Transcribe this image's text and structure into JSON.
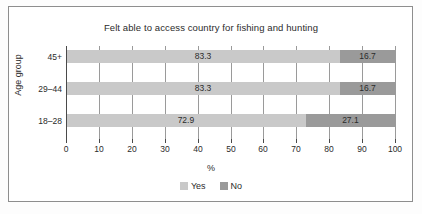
{
  "chart_data": {
    "type": "bar",
    "orientation": "horizontal",
    "stacked": true,
    "stack_total": 100,
    "title": "Felt able to access country for fishing and hunting",
    "xlabel": "%",
    "ylabel": "Age group",
    "categories": [
      "18–28",
      "29–44",
      "45+"
    ],
    "categories_top_to_bottom": [
      "45+",
      "29–44",
      "18–28"
    ],
    "series": [
      {
        "name": "Yes",
        "color": "#c9c9c9",
        "values": [
          72.9,
          83.3,
          83.3
        ]
      },
      {
        "name": "No",
        "color": "#9a9a9a",
        "values": [
          27.1,
          16.7,
          16.7
        ]
      }
    ],
    "xlim": [
      0,
      100
    ],
    "xticks": [
      0,
      10,
      20,
      30,
      40,
      50,
      60,
      70,
      80,
      90,
      100
    ],
    "xtick_labels": [
      "0",
      "10",
      "20",
      "30",
      "40",
      "50",
      "60",
      "70",
      "80",
      "90",
      "100"
    ],
    "grid": true,
    "grid_axis": "x",
    "legend_position": "bottom",
    "data_labels": [
      {
        "category": "45+",
        "yes": "83.3",
        "no": "16.7"
      },
      {
        "category": "29–44",
        "yes": "83.3",
        "no": "16.7"
      },
      {
        "category": "18–28",
        "yes": "72.9",
        "no": "27.1"
      }
    ]
  },
  "rows": [
    {
      "label": "45+",
      "yes": 83.3,
      "no": 16.7,
      "yes_label": "83.3",
      "no_label": "16.7"
    },
    {
      "label": "29–44",
      "yes": 83.3,
      "no": 16.7,
      "yes_label": "83.3",
      "no_label": "16.7"
    },
    {
      "label": "18–28",
      "yes": 72.9,
      "no": 27.1,
      "yes_label": "72.9",
      "no_label": "27.1"
    }
  ],
  "legend": {
    "items": [
      {
        "label": "Yes",
        "color": "#c9c9c9"
      },
      {
        "label": "No",
        "color": "#9a9a9a"
      }
    ]
  },
  "colors": {
    "yes": "#c9c9c9",
    "no": "#9a9a9a",
    "axis": "#4a4a4a",
    "grid": "#9a9a9a",
    "frame": "#8e8e8e",
    "text": "#2b2b2b",
    "background": "#ffffff"
  }
}
